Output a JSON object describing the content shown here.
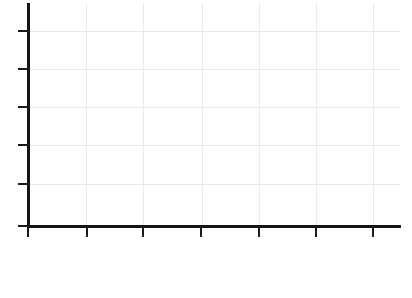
{
  "figure": {
    "background_color": "#ffffff",
    "width": 412,
    "height": 298
  },
  "chart_data": {
    "type": "line",
    "title": "",
    "subtitle": "",
    "xlabel": "",
    "ylabel": "",
    "series": [],
    "categories": [],
    "x": [],
    "values": [],
    "annotations": [],
    "legend": {
      "visible": false,
      "position": "none",
      "entries": []
    },
    "grid": {
      "visible": true,
      "color": "#e9e9e9",
      "horizontal_count": 5,
      "vertical_count": 6
    },
    "axes": {
      "color": "#151515",
      "spine_width_px": 3,
      "x": {
        "tick_count": 7,
        "tick_labels": [],
        "tick_positions_px": [
          28,
          87,
          143,
          201,
          259,
          316,
          373
        ],
        "axis_y_px": 226,
        "start_px": 28,
        "end_px": 400,
        "tick_direction": "out",
        "tick_length_px": 11
      },
      "y": {
        "tick_count": 6,
        "tick_labels": [],
        "tick_positions_px": [
          31,
          69,
          107,
          145,
          184,
          226
        ],
        "axis_x_px": 28,
        "start_px": 3,
        "end_px": 226,
        "tick_direction": "out",
        "tick_length_px": 11
      }
    },
    "gridlines": {
      "horizontal_y_px": [
        31,
        69,
        107,
        145,
        184
      ],
      "vertical_x_px": [
        86,
        143,
        202,
        259,
        316,
        373
      ]
    },
    "note": "Empty axes: no plotted data, no tick labels, no title or legend."
  }
}
